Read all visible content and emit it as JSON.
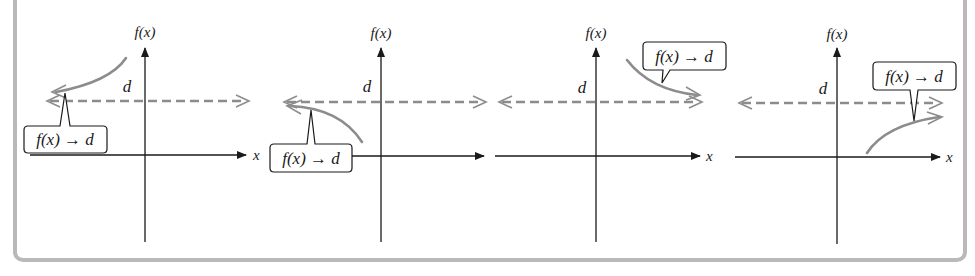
{
  "figure": {
    "colors": {
      "axis": "#1a1a1a",
      "asymptote": "#8c8c8c",
      "curve": "#8c8c8c",
      "frame": "#b9b9b9"
    },
    "panels": [
      {
        "id": 1,
        "y_axis_label": "f(x)",
        "x_axis_label": "x",
        "asymptote_label": "d",
        "callout": "f(x) → d",
        "curve_direction": "left, approaching d from above"
      },
      {
        "id": 2,
        "y_axis_label": "f(x)",
        "x_axis_label": "x",
        "asymptote_label": "d",
        "callout": "f(x) → d",
        "curve_direction": "left, approaching d from below"
      },
      {
        "id": 3,
        "y_axis_label": "f(x)",
        "x_axis_label": "x",
        "asymptote_label": "d",
        "callout": "f(x) → d",
        "curve_direction": "right, approaching d from above"
      },
      {
        "id": 4,
        "y_axis_label": "f(x)",
        "x_axis_label": "x",
        "asymptote_label": "d",
        "callout": "f(x) → d",
        "curve_direction": "right, approaching d from below"
      }
    ]
  }
}
